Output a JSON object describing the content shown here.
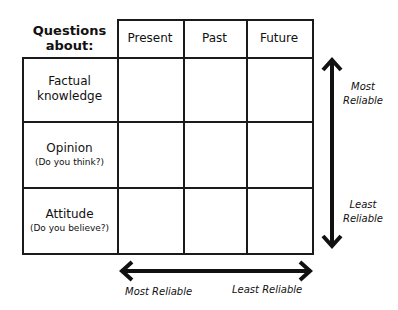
{
  "table": {
    "corner_label": [
      "Questions",
      "about:"
    ],
    "columns": [
      "Present",
      "Past",
      "Future"
    ],
    "rows": [
      {
        "label": "Factual",
        "label2": "knowledge",
        "sub": ""
      },
      {
        "label": "Opinion",
        "label2": "",
        "sub": "(Do you think?)"
      },
      {
        "label": "Attitude",
        "label2": "",
        "sub": "(Do you believe?)"
      }
    ],
    "cells": [
      [
        "",
        "",
        ""
      ],
      [
        "",
        "",
        ""
      ],
      [
        "",
        "",
        ""
      ]
    ]
  },
  "vertical_axis": {
    "top_label": [
      "Most",
      "Reliable"
    ],
    "bottom_label": [
      "Least",
      "Reliable"
    ]
  },
  "horizontal_axis": {
    "left_label": "Most Reliable",
    "right_label": "Least Reliable"
  },
  "colors": {
    "line": "#1a1a1a",
    "background": "#ffffff"
  }
}
